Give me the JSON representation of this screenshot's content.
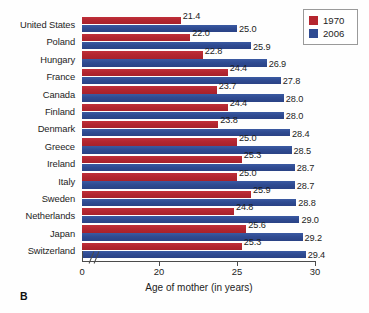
{
  "chart_data": {
    "type": "bar",
    "orientation": "horizontal",
    "title": "",
    "xlabel": "Age of mother (in years)",
    "ylabel": "",
    "xlim": [
      0,
      30
    ],
    "x_axis_break": true,
    "x_ticks": [
      0,
      20,
      25,
      30
    ],
    "x_tick_labels": [
      "0",
      "20",
      "25",
      "30"
    ],
    "grid": false,
    "legend_position": "top-right",
    "categories": [
      "United States",
      "Poland",
      "Hungary",
      "France",
      "Canada",
      "Finland",
      "Denmark",
      "Greece",
      "Ireland",
      "Italy",
      "Sweden",
      "Netherlands",
      "Japan",
      "Switzerland"
    ],
    "series": [
      {
        "name": "1970",
        "color": "#b5262f",
        "values": [
          21.4,
          22.0,
          22.8,
          24.4,
          23.7,
          24.4,
          23.8,
          25.0,
          25.3,
          25.0,
          25.9,
          24.8,
          25.6,
          25.3
        ]
      },
      {
        "name": "2006",
        "color": "#2f4b92",
        "values": [
          25.0,
          25.9,
          26.9,
          27.8,
          28.0,
          28.0,
          28.4,
          28.5,
          28.7,
          28.7,
          28.8,
          29.0,
          29.2,
          29.4
        ]
      }
    ]
  },
  "legend": {
    "items": [
      {
        "label": "1970",
        "color": "#b5262f"
      },
      {
        "label": "2006",
        "color": "#2f4b92"
      }
    ]
  },
  "panel": {
    "label": "B"
  }
}
